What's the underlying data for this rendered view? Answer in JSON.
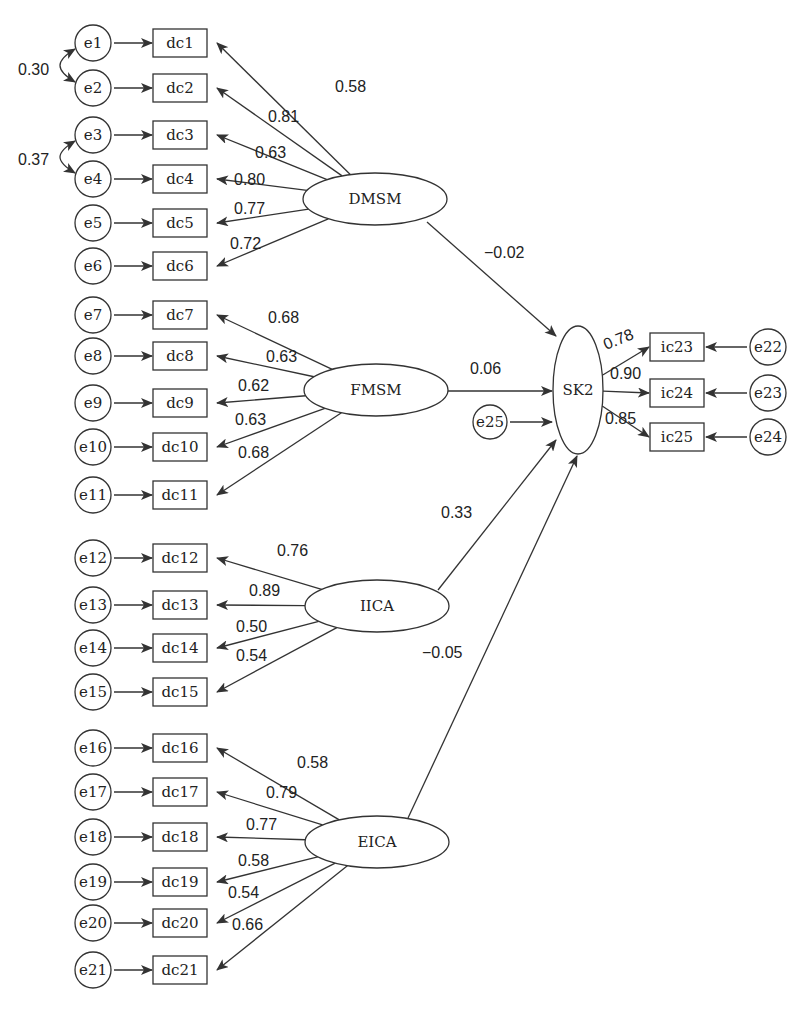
{
  "diagram": {
    "type": "structural-equation-model",
    "colors": {
      "line": "#333333",
      "text": "#222222",
      "background": "#ffffff"
    },
    "latent": [
      {
        "id": "DMSM",
        "label": "DMSM",
        "cx": 375,
        "cy": 199,
        "rx": 72,
        "ry": 26
      },
      {
        "id": "FMSM",
        "label": "FMSM",
        "cx": 376,
        "cy": 390,
        "rx": 72,
        "ry": 26
      },
      {
        "id": "IICA",
        "label": "IICA",
        "cx": 377,
        "cy": 606,
        "rx": 72,
        "ry": 26
      },
      {
        "id": "EICA",
        "label": "EICA",
        "cx": 377,
        "cy": 842,
        "rx": 72,
        "ry": 26
      },
      {
        "id": "SK2",
        "label": "SK2",
        "cx": 578,
        "cy": 390,
        "rx": 25,
        "ry": 64
      }
    ],
    "indicators_left": [
      {
        "err": "e1",
        "obs": "dc1",
        "y": 43,
        "factor": "DMSM",
        "loading": "0.58",
        "lx": 335,
        "ly": 92
      },
      {
        "err": "e2",
        "obs": "dc2",
        "y": 88,
        "factor": "DMSM",
        "loading": "0.81",
        "lx": 268,
        "ly": 122
      },
      {
        "err": "e3",
        "obs": "dc3",
        "y": 135,
        "factor": "DMSM",
        "loading": "0.63",
        "lx": 255,
        "ly": 158
      },
      {
        "err": "e4",
        "obs": "dc4",
        "y": 179,
        "factor": "DMSM",
        "loading": "0.80",
        "lx": 234,
        "ly": 185
      },
      {
        "err": "e5",
        "obs": "dc5",
        "y": 223,
        "factor": "DMSM",
        "loading": "0.77",
        "lx": 234,
        "ly": 214
      },
      {
        "err": "e6",
        "obs": "dc6",
        "y": 266,
        "factor": "DMSM",
        "loading": "0.72",
        "lx": 230,
        "ly": 249
      },
      {
        "err": "e7",
        "obs": "dc7",
        "y": 315,
        "factor": "FMSM",
        "loading": "0.68",
        "lx": 268,
        "ly": 323
      },
      {
        "err": "e8",
        "obs": "dc8",
        "y": 356,
        "factor": "FMSM",
        "loading": "0.63",
        "lx": 266,
        "ly": 362
      },
      {
        "err": "e9",
        "obs": "dc9",
        "y": 403,
        "factor": "FMSM",
        "loading": "0.62",
        "lx": 238,
        "ly": 391
      },
      {
        "err": "e10",
        "obs": "dc10",
        "y": 447,
        "factor": "FMSM",
        "loading": "0.63",
        "lx": 235,
        "ly": 425
      },
      {
        "err": "e11",
        "obs": "dc11",
        "y": 495,
        "factor": "FMSM",
        "loading": "0.68",
        "lx": 238,
        "ly": 458
      },
      {
        "err": "e12",
        "obs": "dc12",
        "y": 558,
        "factor": "IICA",
        "loading": "0.76",
        "lx": 277,
        "ly": 556
      },
      {
        "err": "e13",
        "obs": "dc13",
        "y": 605,
        "factor": "IICA",
        "loading": "0.89",
        "lx": 249,
        "ly": 596
      },
      {
        "err": "e14",
        "obs": "dc14",
        "y": 648,
        "factor": "IICA",
        "loading": "0.50",
        "lx": 236,
        "ly": 632
      },
      {
        "err": "e15",
        "obs": "dc15",
        "y": 692,
        "factor": "IICA",
        "loading": "0.54",
        "lx": 236,
        "ly": 661
      },
      {
        "err": "e16",
        "obs": "dc16",
        "y": 748,
        "factor": "EICA",
        "loading": "0.58",
        "lx": 297,
        "ly": 768
      },
      {
        "err": "e17",
        "obs": "dc17",
        "y": 792,
        "factor": "EICA",
        "loading": "0.79",
        "lx": 266,
        "ly": 798
      },
      {
        "err": "e18",
        "obs": "dc18",
        "y": 837,
        "factor": "EICA",
        "loading": "0.77",
        "lx": 246,
        "ly": 830
      },
      {
        "err": "e19",
        "obs": "dc19",
        "y": 882,
        "factor": "EICA",
        "loading": "0.58",
        "lx": 238,
        "ly": 866
      },
      {
        "err": "e20",
        "obs": "dc20",
        "y": 923,
        "factor": "EICA",
        "loading": "0.54",
        "lx": 228,
        "ly": 898
      },
      {
        "err": "e21",
        "obs": "dc21",
        "y": 970,
        "factor": "EICA",
        "loading": "0.66",
        "lx": 232,
        "ly": 930
      }
    ],
    "indicators_right": [
      {
        "err": "e22",
        "obs": "ic23",
        "y": 347,
        "factor": "SK2",
        "loading": "0.78",
        "lx": 606,
        "ly": 350,
        "rot": -22
      },
      {
        "err": "e23",
        "obs": "ic24",
        "y": 393,
        "factor": "SK2",
        "loading": "0.90",
        "lx": 610,
        "ly": 379,
        "rot": 0
      },
      {
        "err": "e24",
        "obs": "ic25",
        "y": 437,
        "factor": "SK2",
        "loading": "0.85",
        "lx": 605,
        "ly": 424,
        "rot": 0
      }
    ],
    "structural_paths": [
      {
        "from": "DMSM",
        "to": "SK2",
        "coef": "−0.02",
        "x1": 427,
        "y1": 222,
        "x2": 556,
        "y2": 336,
        "lx": 484,
        "ly": 258
      },
      {
        "from": "FMSM",
        "to": "SK2",
        "coef": "0.06",
        "x1": 448,
        "y1": 391,
        "x2": 552,
        "y2": 391,
        "lx": 470,
        "ly": 374
      },
      {
        "from": "IICA",
        "to": "SK2",
        "coef": "0.33",
        "x1": 438,
        "y1": 590,
        "x2": 556,
        "y2": 440,
        "lx": 441,
        "ly": 518
      },
      {
        "from": "EICA",
        "to": "SK2",
        "coef": "−0.05",
        "x1": 408,
        "y1": 818,
        "x2": 577,
        "y2": 456,
        "lx": 422,
        "ly": 658
      }
    ],
    "residual": {
      "id": "e25",
      "label": "e25",
      "cx": 490,
      "cy": 422,
      "r": 17
    },
    "covariances": [
      {
        "between": [
          "e1",
          "e2"
        ],
        "value": "0.30",
        "lx": 18,
        "ly": 75
      },
      {
        "between": [
          "e3",
          "e4"
        ],
        "value": "0.37",
        "lx": 18,
        "ly": 165
      }
    ]
  }
}
